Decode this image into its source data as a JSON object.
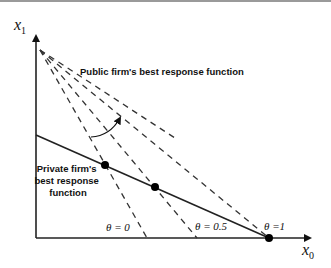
{
  "diagram": {
    "axes": {
      "y_label": "x",
      "y_label_sub": "1",
      "x_label": "x",
      "x_label_sub": "0"
    },
    "labels": {
      "public": "Public firm's best response function",
      "private_line1": "Private firm's",
      "private_line2": "best response",
      "private_line3": "function",
      "theta0": "θ = 0",
      "theta05": "θ = 0.5",
      "theta1": "θ =1"
    },
    "colors": {
      "line": "#222222",
      "dashed": "#333333",
      "dot": "#000000",
      "border": "#9a9a9a"
    },
    "geometry": {
      "origin": [
        36,
        238
      ],
      "apex": [
        38,
        48
      ],
      "private_start": [
        36,
        135
      ],
      "private_end": [
        269,
        238
      ],
      "dashed_ends_x": [
        147,
        197,
        269
      ],
      "dashed_extra_end": [
        300,
        238
      ],
      "intersections": [
        [
          105,
          165
        ],
        [
          155,
          187
        ],
        [
          269,
          238
        ]
      ]
    }
  }
}
